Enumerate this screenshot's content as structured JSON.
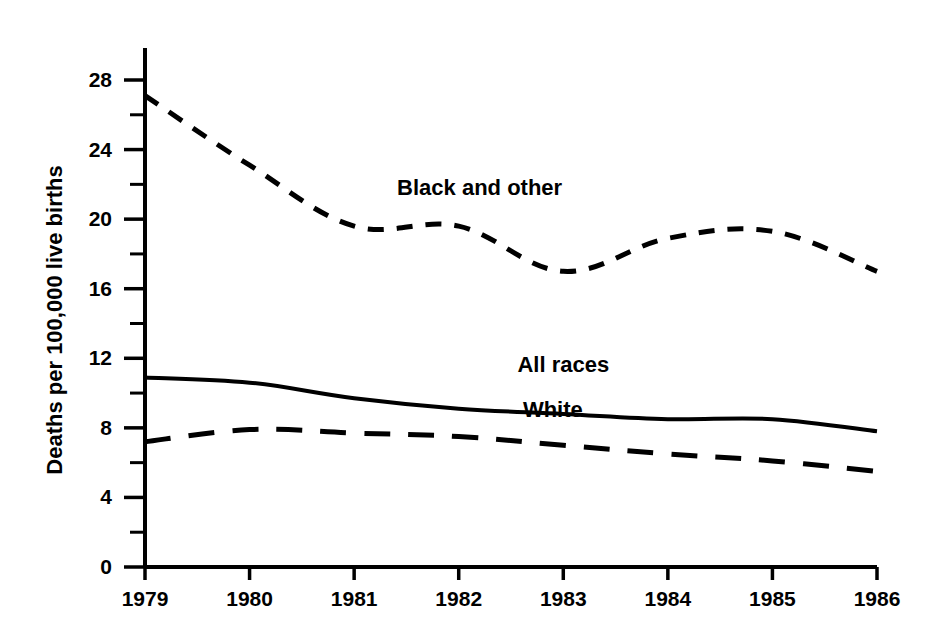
{
  "chart_data": {
    "type": "line",
    "title": "",
    "xlabel": "",
    "ylabel": "Deaths per 100,000 live births",
    "x": [
      1979,
      1980,
      1981,
      1982,
      1983,
      1984,
      1985,
      1986
    ],
    "categories": [
      "1979",
      "1980",
      "1981",
      "1982",
      "1983",
      "1984",
      "1985",
      "1986"
    ],
    "xlim": [
      1979,
      1986
    ],
    "ylim": [
      0,
      28
    ],
    "ytick_values": [
      0,
      4,
      8,
      12,
      16,
      20,
      24,
      28
    ],
    "ytick_labels": [
      "0",
      "4",
      "8",
      "12",
      "16",
      "20",
      "24",
      "28"
    ],
    "yminor_values": [
      2,
      6,
      10,
      14,
      18,
      22,
      26
    ],
    "xtick_labels": [
      "1979",
      "1980",
      "1981",
      "1982",
      "1983",
      "1984",
      "1985",
      "1986"
    ],
    "grid": false,
    "legend": "inline-labels",
    "series": [
      {
        "name": "Black and other",
        "style": "dashed-short",
        "label_x": 1982.2,
        "label_y": 21.4,
        "values": [
          27.1,
          23.1,
          19.6,
          19.6,
          17.0,
          18.9,
          19.3,
          17.0
        ]
      },
      {
        "name": "All races",
        "style": "solid",
        "label_x": 1983.0,
        "label_y": 11.2,
        "values": [
          10.9,
          10.6,
          9.7,
          9.1,
          8.8,
          8.5,
          8.5,
          7.8
        ]
      },
      {
        "name": "White",
        "style": "dashed-long",
        "label_x": 1982.9,
        "label_y": 8.6,
        "values": [
          7.2,
          7.9,
          7.7,
          7.5,
          7.0,
          6.5,
          6.1,
          5.5
        ]
      }
    ]
  },
  "axes": {
    "y_axis_title": "Deaths per 100,000 live births"
  },
  "colors": {
    "ink": "#000000",
    "background": "#ffffff"
  }
}
